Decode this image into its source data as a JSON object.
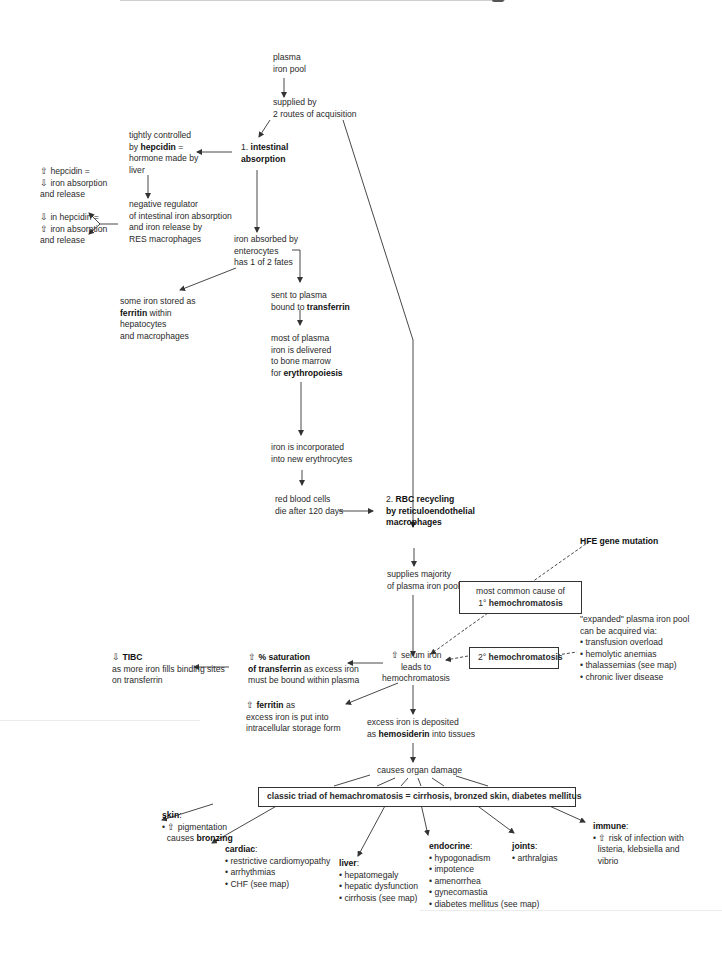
{
  "nodes": {
    "plasma_pool": [
      "plasma",
      "iron pool"
    ],
    "supplied_by": [
      "supplied by",
      "2 routes of acquisition"
    ],
    "intestinal": {
      "prefix": "1. ",
      "bold1": "intestinal",
      "bold2": "absorption"
    },
    "hepcidin_ctrl": {
      "l1": "tightly controlled",
      "l2_pre": "by ",
      "l2_bold": "hepcidin",
      "l2_post": " =",
      "l3": "hormone made by",
      "l4": "liver"
    },
    "neg_regulator": [
      "negative regulator",
      "of intestinal iron absorption",
      "and iron release by",
      "RES macrophages"
    ],
    "up_hepcidin": [
      "hepcidin =",
      "iron absorption",
      "and release"
    ],
    "down_hepcidin": [
      "in hepcidin =",
      "iron absorption",
      "and release"
    ],
    "absorbed": [
      "iron absorbed by",
      "enterocytes",
      "has 1 of 2 fates"
    ],
    "ferritin_store": {
      "l1": "some iron stored as",
      "l2_bold": "ferritin",
      "l2_post": " within",
      "l3": "hepatocytes",
      "l4": "and macrophages"
    },
    "transferrin": {
      "l1": "sent to plasma",
      "l2_pre": "bound to ",
      "l2_bold": "transferrin"
    },
    "bone_marrow": {
      "l1": "most of plasma",
      "l2": "iron is delivered",
      "l3": "to bone marrow",
      "l4_pre": "for ",
      "l4_bold": "erythropoiesis"
    },
    "incorporated": [
      "iron is incorporated",
      "into new erythrocytes"
    ],
    "rbc_die": [
      "red blood cells",
      "die after 120 days"
    ],
    "rbc_recycling": {
      "prefix": "2. ",
      "bold1": "RBC recycling",
      "bold2": "by reticuloendothelial",
      "bold3": "macrophages"
    },
    "supplies_majority": [
      "supplies majority",
      "of plasma iron pool"
    ],
    "hfe": "HFE gene mutation",
    "primary": {
      "l1": "most common cause of",
      "l2_pre": "1° ",
      "l2_bold": "hemochromatosis"
    },
    "secondary": {
      "pre": "2° ",
      "bold": "hemochromatosis"
    },
    "expanded": {
      "l1": "\"expanded\" plasma iron pool",
      "l2": "can be acquired via:",
      "items": [
        "transfusion overload",
        "hemolytic anemias",
        "thalassemias (see map)",
        "chronic liver disease"
      ]
    },
    "serum_iron": [
      "serum iron",
      "leads to",
      "hemochromatosis"
    ],
    "saturation": {
      "bold1": "% saturation",
      "l2_bold": "of transferrin",
      "l2_post": " as excess iron",
      "l3": "must be bound within plasma"
    },
    "tibc": {
      "bold": "TIBC",
      "l2": "as more iron fills binding sites",
      "l3": "on transferrin"
    },
    "ferritin_up": {
      "bold": "ferritin",
      "post": " as",
      "l2": "excess iron is put into",
      "l3": "intracellular storage form"
    },
    "hemosiderin": {
      "l1": "excess iron is deposited",
      "l2_pre": "as ",
      "l2_bold": "hemosiderin",
      "l2_post": " into tissues"
    },
    "organ_damage": "causes organ damage",
    "triad": "classic triad of hemachromatosis = cirrhosis, bronzed skin, diabetes mellitus",
    "skin": {
      "title": "skin",
      "l1": "pigmentation",
      "l2_pre": "causes ",
      "l2_bold": "bronzing"
    },
    "cardiac": {
      "title": "cardiac",
      "items": [
        "restrictive cardiomyopathy",
        "arrhythmias",
        "CHF (see map)"
      ]
    },
    "liver": {
      "title": "liver",
      "items": [
        "hepatomegaly",
        "hepatic dysfunction",
        "cirrhosis (see map)"
      ]
    },
    "endocrine": {
      "title": "endocrine",
      "items": [
        "hypogonadism",
        "impotence",
        "amenorrhea",
        "gynecomastia",
        "diabetes mellitus (see map)"
      ]
    },
    "joints": {
      "title": "joints",
      "items": [
        "arthralgias"
      ]
    },
    "immune": {
      "title": "immune",
      "l1": "risk of infection with",
      "l2": "listeria, klebsiella and",
      "l3": "vibrio"
    }
  },
  "colors": {
    "line": "#333333",
    "text": "#2a2a2a",
    "bold": "#111111",
    "background": "#ffffff"
  }
}
